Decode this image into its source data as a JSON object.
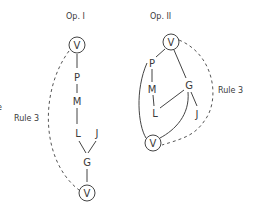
{
  "diagram": {
    "type": "tree-comparison",
    "panels": [
      {
        "title": "Op. I",
        "nodes": [
          {
            "id": "V1",
            "label": "V",
            "circled": true
          },
          {
            "id": "P",
            "label": "P"
          },
          {
            "id": "M",
            "label": "M"
          },
          {
            "id": "L",
            "label": "L"
          },
          {
            "id": "J",
            "label": "J"
          },
          {
            "id": "G",
            "label": "G"
          },
          {
            "id": "V2",
            "label": "V",
            "circled": true
          }
        ],
        "edges": [
          [
            "V1",
            "P"
          ],
          [
            "P",
            "M"
          ],
          [
            "M",
            "L"
          ],
          [
            "L",
            "G"
          ],
          [
            "J",
            "G"
          ],
          [
            "G",
            "V2"
          ]
        ],
        "dashed_edges": [
          [
            "V1",
            "V2"
          ]
        ],
        "rule_label": "Rule 3",
        "partial_left_text": "e"
      },
      {
        "title": "Op. II",
        "nodes": [
          {
            "id": "V1",
            "label": "V",
            "circled": true
          },
          {
            "id": "P",
            "label": "P"
          },
          {
            "id": "M",
            "label": "M"
          },
          {
            "id": "G",
            "label": "G"
          },
          {
            "id": "L",
            "label": "L"
          },
          {
            "id": "J",
            "label": "J"
          },
          {
            "id": "V2",
            "label": "V",
            "circled": true
          }
        ],
        "edges": [
          [
            "V1",
            "P"
          ],
          [
            "P",
            "M"
          ],
          [
            "M",
            "L"
          ],
          [
            "V1",
            "G"
          ],
          [
            "G",
            "L"
          ],
          [
            "G",
            "J"
          ],
          [
            "G",
            "V2"
          ],
          [
            "P",
            "V2"
          ]
        ],
        "dashed_edges": [
          [
            "V1",
            "V2"
          ]
        ],
        "rule_label": "Rule 3"
      }
    ]
  }
}
